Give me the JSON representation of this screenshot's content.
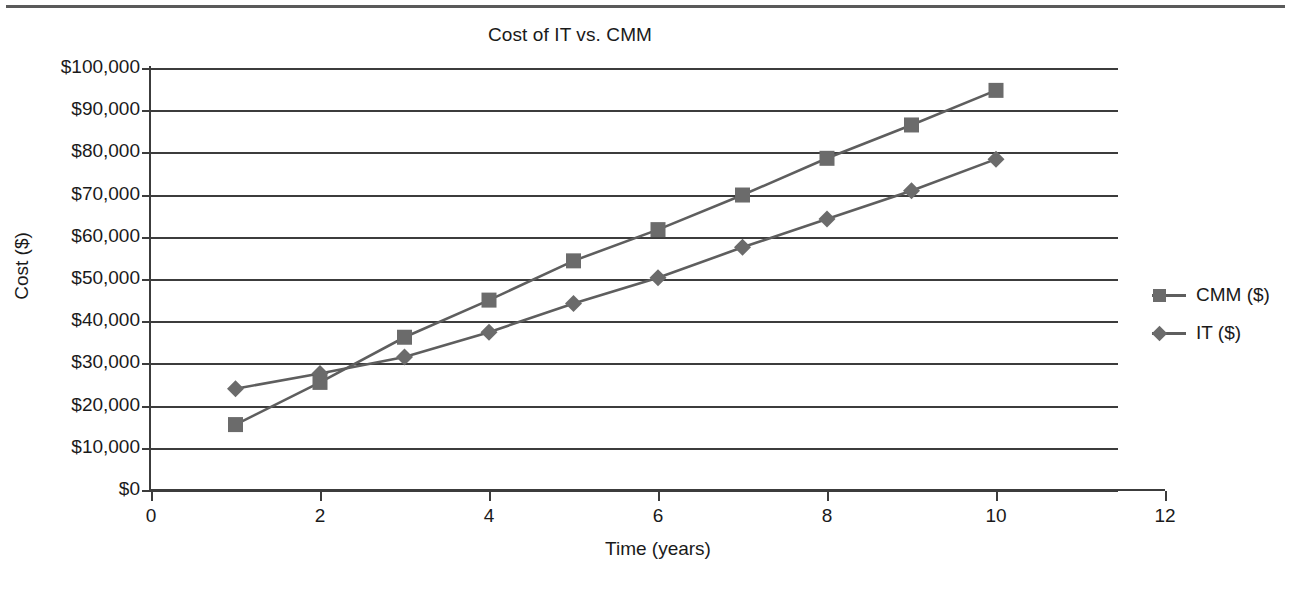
{
  "chart_data": {
    "type": "line",
    "title": "Cost of IT vs. CMM",
    "xlabel": "Time (years)",
    "ylabel": "Cost ($)",
    "x": [
      1,
      2,
      3,
      4,
      5,
      6,
      7,
      8,
      9,
      10
    ],
    "xlim": [
      0,
      12
    ],
    "ylim": [
      0,
      100000
    ],
    "xticks": [
      0,
      2,
      4,
      6,
      8,
      10,
      12
    ],
    "xtick_labels": [
      "0",
      "2",
      "4",
      "6",
      "8",
      "10",
      "12"
    ],
    "yticks": [
      0,
      10000,
      20000,
      30000,
      40000,
      50000,
      60000,
      70000,
      80000,
      90000,
      100000
    ],
    "ytick_labels": [
      "$0",
      "$10,000",
      "$20,000",
      "$30,000",
      "$40,000",
      "$50,000",
      "$60,000",
      "$70,000",
      "$80,000",
      "$90,000",
      "$100,000"
    ],
    "grid": "horizontal",
    "legend_position": "right",
    "series": [
      {
        "name": "CMM ($)",
        "marker": "square",
        "color": "#6b6b6b",
        "values": [
          15500,
          25500,
          36200,
          45000,
          54300,
          61700,
          69900,
          78600,
          86500,
          94700
        ]
      },
      {
        "name": "IT ($)",
        "marker": "diamond",
        "color": "#6b6b6b",
        "values": [
          24000,
          27600,
          31500,
          37400,
          44200,
          50300,
          57500,
          64200,
          70900,
          78400
        ]
      }
    ]
  },
  "legend": {
    "items": [
      {
        "label": "CMM ($)",
        "marker": "square"
      },
      {
        "label": "IT ($)",
        "marker": "diamond"
      }
    ]
  },
  "colors": {
    "axis": "#3c3c3c",
    "gridline": "#3c3c3c",
    "marker": "#6b6b6b",
    "line": "#5e5e5e",
    "text": "#1a1a1a",
    "background": "#ffffff",
    "top_rule": "#5a5a5a"
  }
}
